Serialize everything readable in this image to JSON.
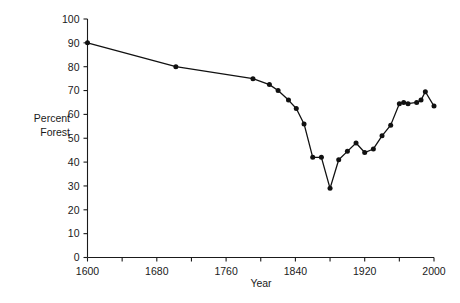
{
  "chart_data": {
    "type": "line",
    "title": "",
    "xlabel": "Year",
    "ylabel": "Percent Forest",
    "ylabel_lines": [
      "Percent",
      "Forest"
    ],
    "xlim": [
      1600,
      2000
    ],
    "ylim": [
      0,
      100
    ],
    "grid": false,
    "legend": "none",
    "xticks": [
      1600,
      1680,
      1760,
      1840,
      1920,
      2000
    ],
    "xtick_labels": [
      "1600",
      "1680",
      "1760",
      "1840",
      "1920",
      "2000"
    ],
    "x_minor_ticks": [
      1640,
      1720,
      1800,
      1880,
      1960
    ],
    "yticks": [
      0,
      10,
      20,
      30,
      40,
      50,
      60,
      70,
      80,
      90,
      100
    ],
    "ytick_labels": [
      "0",
      "10",
      "20",
      "30",
      "40",
      "50",
      "60",
      "70",
      "80",
      "90",
      "100"
    ],
    "marker": "filled-circle",
    "line_color": "#111111",
    "marker_color": "#111111",
    "axis_color": "#1a1a1a",
    "background_color": "#ffffff",
    "series": [
      {
        "name": "Percent Forest",
        "x": [
          1600,
          1702,
          1791,
          1810,
          1820,
          1832,
          1841,
          1850,
          1860,
          1870,
          1880,
          1890,
          1900,
          1910,
          1920,
          1930,
          1940,
          1950,
          1960,
          1965,
          1970,
          1980,
          1985,
          1990,
          2000
        ],
        "y": [
          90,
          80,
          75,
          72.5,
          70,
          66,
          62.5,
          56,
          42,
          42,
          29,
          41,
          44.5,
          48,
          44,
          45.5,
          51,
          55.5,
          64.5,
          65,
          64.5,
          65,
          66,
          69.5,
          63.5
        ],
        "values_note": "percent of land area in forest cover"
      }
    ],
    "points": [
      {
        "x": 1600,
        "y": 90
      },
      {
        "x": 1702,
        "y": 80
      },
      {
        "x": 1791,
        "y": 75
      },
      {
        "x": 1810,
        "y": 72.5
      },
      {
        "x": 1820,
        "y": 70
      },
      {
        "x": 1832,
        "y": 66
      },
      {
        "x": 1841,
        "y": 62.5
      },
      {
        "x": 1850,
        "y": 56
      },
      {
        "x": 1860,
        "y": 42
      },
      {
        "x": 1870,
        "y": 42
      },
      {
        "x": 1880,
        "y": 29
      },
      {
        "x": 1890,
        "y": 41
      },
      {
        "x": 1900,
        "y": 44.5
      },
      {
        "x": 1910,
        "y": 48
      },
      {
        "x": 1920,
        "y": 44
      },
      {
        "x": 1930,
        "y": 45.5
      },
      {
        "x": 1940,
        "y": 51
      },
      {
        "x": 1950,
        "y": 55.5
      },
      {
        "x": 1960,
        "y": 64.5
      },
      {
        "x": 1965,
        "y": 65
      },
      {
        "x": 1970,
        "y": 64.5
      },
      {
        "x": 1980,
        "y": 65
      },
      {
        "x": 1985,
        "y": 66
      },
      {
        "x": 1990,
        "y": 69.5
      },
      {
        "x": 2000,
        "y": 63.5
      }
    ]
  }
}
